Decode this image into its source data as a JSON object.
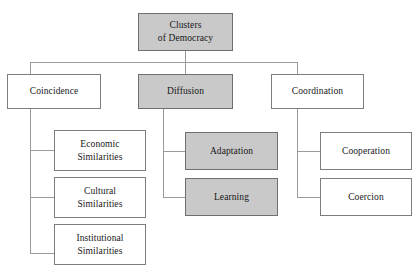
{
  "diagram": {
    "title": "Clusters of Democracy",
    "type": "hierarchy-tree",
    "colors": {
      "shaded_fill": "#c9c9c9",
      "plain_fill": "#ffffff",
      "border": "#7d7d7d",
      "edge": "#9a9a9a",
      "text": "#171717"
    },
    "root": {
      "label": "Clusters\nof Democracy",
      "shaded": true
    },
    "branches": [
      {
        "label": "Coincidence",
        "shaded": false,
        "children": [
          {
            "label": "Economic\nSimilarities",
            "shaded": false
          },
          {
            "label": "Cultural\nSimilarities",
            "shaded": false
          },
          {
            "label": "Institutional\nSimilarities",
            "shaded": false
          }
        ]
      },
      {
        "label": "Diffusion",
        "shaded": true,
        "children": [
          {
            "label": "Adaptation",
            "shaded": true
          },
          {
            "label": "Learning",
            "shaded": true
          }
        ]
      },
      {
        "label": "Coordination",
        "shaded": false,
        "children": [
          {
            "label": "Cooperation",
            "shaded": false
          },
          {
            "label": "Coercion",
            "shaded": false
          }
        ]
      }
    ]
  }
}
